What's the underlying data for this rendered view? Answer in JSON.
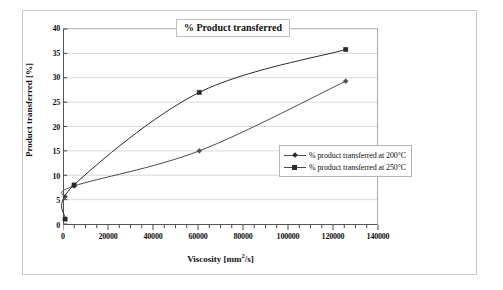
{
  "chart_data": {
    "type": "line",
    "title": "% Product transferred",
    "xlabel": "Viscosity [mm2/s]",
    "xlabel_base": "Viscosity [mm",
    "xlabel_sup": "2",
    "xlabel_tail": "/s]",
    "ylabel": "Product transferred [%]",
    "xlim": [
      0,
      140000
    ],
    "ylim": [
      0,
      40
    ],
    "xticks": [
      0,
      20000,
      40000,
      60000,
      80000,
      100000,
      120000,
      140000
    ],
    "xtick_labels": [
      "0",
      "20000",
      "40000",
      "60000",
      "80000",
      "100000",
      "120000",
      "140000"
    ],
    "yticks": [
      0,
      5,
      10,
      15,
      20,
      25,
      30,
      35,
      40
    ],
    "ytick_labels": [
      "0",
      "5",
      "10",
      "15",
      "20",
      "25",
      "30",
      "35",
      "40"
    ],
    "x_minor_tick_step": 5000,
    "grid": {
      "horizontal": true,
      "vertical": false,
      "color": "#d9d9d9"
    },
    "legend_position": "center-right",
    "series": [
      {
        "name": "% product transferred at 200°C",
        "marker": "diamond",
        "color": "#4a4a4a",
        "points": [
          {
            "x": 500,
            "y": 5.6
          },
          {
            "x": 4500,
            "y": 7.8
          },
          {
            "x": 60500,
            "y": 15.0
          },
          {
            "x": 126000,
            "y": 29.3
          }
        ]
      },
      {
        "name": "% product transferred at 250°C",
        "marker": "square",
        "color": "#2a2a2a",
        "points": [
          {
            "x": 500,
            "y": 1.0
          },
          {
            "x": 4500,
            "y": 8.0
          },
          {
            "x": 60500,
            "y": 27.0
          },
          {
            "x": 126000,
            "y": 35.8
          }
        ]
      }
    ]
  },
  "legend": {
    "entries": [
      {
        "label": "% product transferred at 200°C"
      },
      {
        "label": "% product transferred at 250°C"
      }
    ]
  }
}
